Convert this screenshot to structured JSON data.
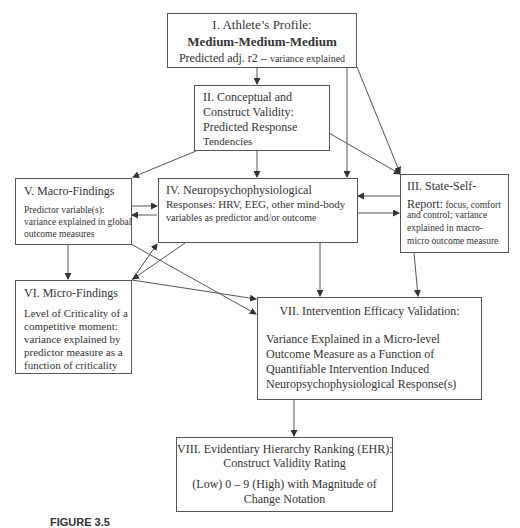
{
  "figure": {
    "boxes": {
      "I": {
        "title": "I. Athlete’s Profile:",
        "emphasis": "Medium-Medium-Medium",
        "line3_a": "Predicted adj. r2 – ",
        "line3_b": "variance explained"
      },
      "II": {
        "lines": [
          "II. Conceptual and",
          "Construct Validity:",
          "Predicted Response",
          "Tendencies"
        ]
      },
      "III": {
        "title_1": "III. State-Self-",
        "title_2": "Report:",
        "lines": [
          " focus, comfort",
          "and control; variance",
          "explained in macro-",
          "micro outcome measure"
        ]
      },
      "IV": {
        "lines": [
          "IV. Neuropsychophysiological",
          "Responses: HRV, EEG, other mind-body",
          "variables as predictor and/or outcome"
        ]
      },
      "V": {
        "title": "V. Macro-Findings",
        "lines": [
          "Predictor variable(s):",
          "variance explained in global",
          "outcome measures"
        ]
      },
      "VI": {
        "title": "VI. Micro-Findings",
        "lines": [
          "Level of Criticality of a",
          "competitive moment:",
          "variance explained by",
          "predictor measure as a",
          "function of criticality"
        ]
      },
      "VII": {
        "title": "VII. Intervention Efficacy Validation:",
        "lines": [
          "Variance Explained in a Micro-level",
          "Outcome Measure as a Function of",
          "Quantifiable Intervention Induced",
          "Neuropsychophysiological Response(s)"
        ]
      },
      "VIII": {
        "lines": [
          "VIII. Evidentiary Hierarchy Ranking (EHR):",
          "Construct Validity Rating",
          "(Low) 0 – 9 (High) with Magnitude of",
          "Change Notation"
        ]
      }
    },
    "caption": {
      "label": "FIGURE 3.5",
      "text": " "
    },
    "colors": {
      "line": "#444444",
      "text": "#333333",
      "border": "#555555"
    }
  }
}
